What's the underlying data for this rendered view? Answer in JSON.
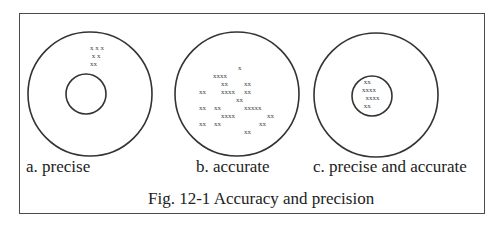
{
  "figure": {
    "caption": "Fig. 12-1 Accuracy and precision",
    "panels": [
      {
        "label": "a. precise",
        "outer_circle": {
          "cx": 90,
          "cy": 94,
          "r": 62
        },
        "inner_circle": {
          "cx": 86,
          "cy": 94,
          "r": 20
        },
        "marks": [
          "x x x",
          " x x",
          "xx"
        ]
      },
      {
        "label": "b. accurate",
        "outer_circle": {
          "cx": 237,
          "cy": 94,
          "r": 62
        },
        "inner_circle": null,
        "marks": [
          {
            "text": "x",
            "x": 238,
            "y": 64
          },
          {
            "text": "xxxx",
            "x": 213,
            "y": 72
          },
          {
            "text": "xx",
            "x": 221,
            "y": 80
          },
          {
            "text": "xx",
            "x": 244,
            "y": 80
          },
          {
            "text": "xx",
            "x": 199,
            "y": 88
          },
          {
            "text": "xxxx",
            "x": 221,
            "y": 88
          },
          {
            "text": "xx",
            "x": 244,
            "y": 88
          },
          {
            "text": "xx",
            "x": 236,
            "y": 96
          },
          {
            "text": "xx",
            "x": 199,
            "y": 104
          },
          {
            "text": "xx",
            "x": 214,
            "y": 104
          },
          {
            "text": "xxxxx",
            "x": 244,
            "y": 104
          },
          {
            "text": "xxxx",
            "x": 221,
            "y": 112
          },
          {
            "text": "xx",
            "x": 267,
            "y": 112
          },
          {
            "text": "xx",
            "x": 199,
            "y": 120
          },
          {
            "text": "xx",
            "x": 214,
            "y": 120
          },
          {
            "text": "xx",
            "x": 259,
            "y": 120
          },
          {
            "text": "xx",
            "x": 244,
            "y": 128
          }
        ]
      },
      {
        "label": "c. precise and accurate",
        "outer_circle": {
          "cx": 376,
          "cy": 95,
          "r": 62
        },
        "inner_circle": {
          "cx": 372,
          "cy": 96,
          "r": 20
        },
        "marks": [
          " xx",
          "xxxx",
          "  xxxx",
          " xx"
        ]
      }
    ],
    "colors": {
      "stroke": "#333333",
      "text": "#222222",
      "frame": "#4a4a4a"
    }
  }
}
